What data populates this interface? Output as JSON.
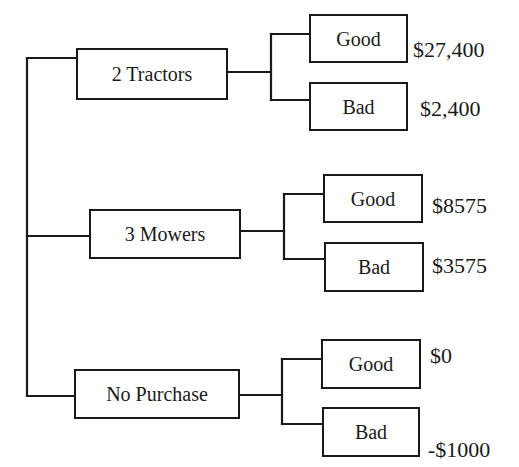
{
  "diagram": {
    "type": "decision-tree",
    "root": {
      "options": [
        {
          "label": "2 Tractors",
          "outcomes": [
            {
              "label": "Good",
              "value": "$27,400"
            },
            {
              "label": "Bad",
              "value": "$2,400"
            }
          ]
        },
        {
          "label": "3 Mowers",
          "outcomes": [
            {
              "label": "Good",
              "value": "$8575"
            },
            {
              "label": "Bad",
              "value": "$3575"
            }
          ]
        },
        {
          "label": "No Purchase",
          "outcomes": [
            {
              "label": "Good",
              "value": "$0"
            },
            {
              "label": "Bad",
              "value": "-$1000"
            }
          ]
        }
      ]
    }
  },
  "colors": {
    "line": "#1a1a1a",
    "background": "#ffffff",
    "text": "#1a1a1a"
  }
}
